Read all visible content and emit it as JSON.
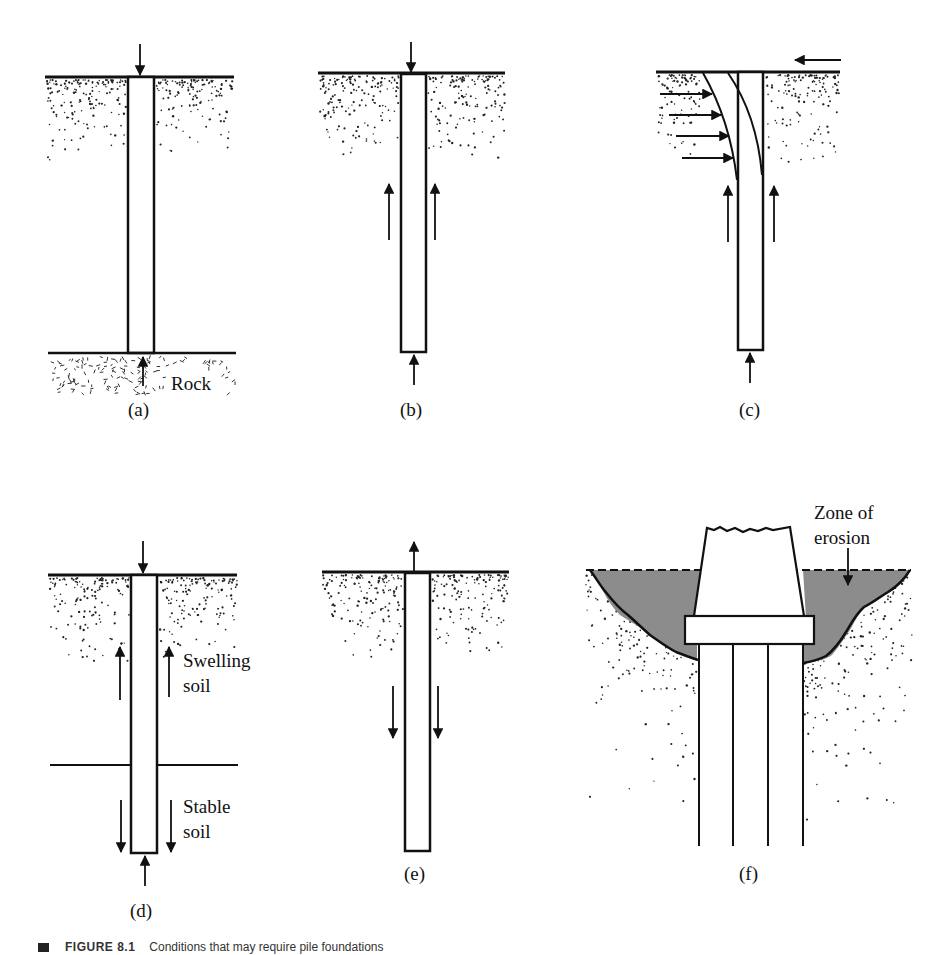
{
  "figure": {
    "panels": [
      {
        "id": "a",
        "label": "(a)",
        "annotations": [
          "Rock"
        ],
        "description": "End-bearing pile on rock"
      },
      {
        "id": "b",
        "label": "(b)",
        "annotations": [],
        "description": "Friction pile with skin friction and end bearing"
      },
      {
        "id": "c",
        "label": "(c)",
        "annotations": [],
        "description": "Laterally loaded pile"
      },
      {
        "id": "d",
        "label": "(d)",
        "annotations": [
          "Swelling soil",
          "Stable soil"
        ],
        "description": "Pile in swelling soil over stable soil"
      },
      {
        "id": "e",
        "label": "(e)",
        "annotations": [],
        "description": "Uplift pile"
      },
      {
        "id": "f",
        "label": "(f)",
        "annotations": [
          "Zone of erosion"
        ],
        "description": "Pile group under bridge pier with erosion zone"
      }
    ],
    "text": {
      "rock": "Rock",
      "swelling_1": "Swelling",
      "swelling_2": "soil",
      "stable_1": "Stable",
      "stable_2": "soil",
      "zone_1": "Zone of",
      "zone_2": "erosion"
    },
    "caption": {
      "number": "FIGURE 8.1",
      "text": "Conditions that may require pile foundations"
    },
    "colors": {
      "ink": "#111111",
      "erosion_fill": "#8c8c8c",
      "background": "#ffffff"
    }
  }
}
